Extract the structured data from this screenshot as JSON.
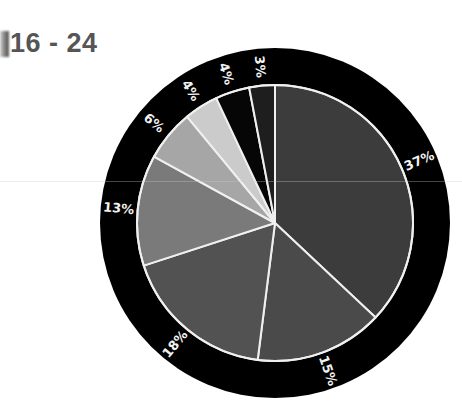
{
  "title": "16 - 24",
  "chart_data": {
    "type": "pie",
    "title": "16 - 24",
    "categories": [
      "Segment A",
      "Segment B",
      "Segment C",
      "Segment D",
      "Segment E",
      "Segment F",
      "Segment G",
      "Segment H"
    ],
    "values": [
      37,
      15,
      18,
      13,
      6,
      4,
      4,
      3
    ],
    "labels": [
      "37%",
      "15%",
      "18%",
      "13%",
      "6%",
      "4%",
      "4%",
      "3%"
    ],
    "colors": [
      "#3c3c3c",
      "#4a4a4a",
      "#525252",
      "#7a7a7a",
      "#a6a6a6",
      "#cbcbcb",
      "#060606",
      "#1e1e1e"
    ],
    "start_angle_deg": 0,
    "direction": "clockwise",
    "legend": "none",
    "ring_color": "#000000",
    "separator_color": "#f0f0f0",
    "label_color": "#f2f2f2"
  },
  "geometry": {
    "cx": 275,
    "cy": 223,
    "outer_radius": 175,
    "inner_radius": 138,
    "label_radius": 157
  }
}
